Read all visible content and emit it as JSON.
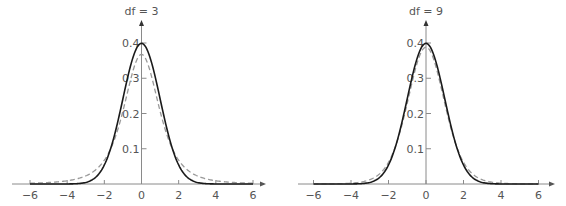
{
  "chart_data": [
    {
      "type": "line",
      "title": "df = 3",
      "xlabel": "",
      "ylabel": "",
      "xlim": [
        -6,
        6
      ],
      "ylim": [
        0,
        0.4
      ],
      "x_ticks": [
        -6,
        -4,
        -2,
        0,
        2,
        4,
        6
      ],
      "x_tick_labels": [
        "−6",
        "−4",
        "−2",
        "0",
        "2",
        "4",
        "6"
      ],
      "y_ticks": [
        0.1,
        0.2,
        0.3,
        0.4
      ],
      "y_tick_labels": [
        "0.1",
        "0.2",
        "0.3",
        "0.4"
      ],
      "grid": false,
      "legend": null,
      "series": [
        {
          "name": "Standard normal",
          "style": "solid",
          "color": "#1a1a1a",
          "x": [
            -6,
            -4,
            -3,
            -2,
            -1.5,
            -1,
            -0.5,
            0,
            0.5,
            1,
            1.5,
            2,
            3,
            4,
            6
          ],
          "values": [
            0.0,
            0.0001,
            0.0044,
            0.054,
            0.1295,
            0.242,
            0.3521,
            0.3989,
            0.3521,
            0.242,
            0.1295,
            0.054,
            0.0044,
            0.0001,
            0.0
          ]
        },
        {
          "name": "t (df = 3)",
          "style": "dashed",
          "color": "#999999",
          "x": [
            -6,
            -4,
            -3,
            -2,
            -1.5,
            -1,
            -0.5,
            0,
            0.5,
            1,
            1.5,
            2,
            3,
            4,
            6
          ],
          "values": [
            0.0042,
            0.0092,
            0.0229,
            0.0675,
            0.1196,
            0.2067,
            0.3125,
            0.3676,
            0.3125,
            0.2067,
            0.1196,
            0.0675,
            0.0229,
            0.0092,
            0.0042
          ]
        }
      ]
    },
    {
      "type": "line",
      "title": "df = 9",
      "xlabel": "",
      "ylabel": "",
      "xlim": [
        -6,
        6
      ],
      "ylim": [
        0,
        0.4
      ],
      "x_ticks": [
        -6,
        -4,
        -2,
        0,
        2,
        4,
        6
      ],
      "x_tick_labels": [
        "−6",
        "−4",
        "−2",
        "0",
        "2",
        "4",
        "6"
      ],
      "y_ticks": [
        0.1,
        0.2,
        0.3,
        0.4
      ],
      "y_tick_labels": [
        "0.1",
        "0.2",
        "0.3",
        "0.4"
      ],
      "grid": false,
      "legend": null,
      "series": [
        {
          "name": "Standard normal",
          "style": "solid",
          "color": "#1a1a1a",
          "x": [
            -6,
            -4,
            -3,
            -2,
            -1.5,
            -1,
            -0.5,
            0,
            0.5,
            1,
            1.5,
            2,
            3,
            4,
            6
          ],
          "values": [
            0.0,
            0.0001,
            0.0044,
            0.054,
            0.1295,
            0.242,
            0.3521,
            0.3989,
            0.3521,
            0.242,
            0.1295,
            0.054,
            0.0044,
            0.0001,
            0.0
          ]
        },
        {
          "name": "t (df = 9)",
          "style": "dashed",
          "color": "#999999",
          "x": [
            -6,
            -4,
            -3,
            -2,
            -1.5,
            -1,
            -0.5,
            0,
            0.5,
            1,
            1.5,
            2,
            3,
            4,
            6
          ],
          "values": [
            0.0001,
            0.0021,
            0.0109,
            0.0597,
            0.1251,
            0.2326,
            0.3426,
            0.388,
            0.3426,
            0.2326,
            0.1251,
            0.0597,
            0.0109,
            0.0021,
            0.0001
          ]
        }
      ]
    }
  ],
  "panels": [
    {
      "title": "df = 3",
      "df": 3
    },
    {
      "title": "df = 9",
      "df": 9
    }
  ]
}
